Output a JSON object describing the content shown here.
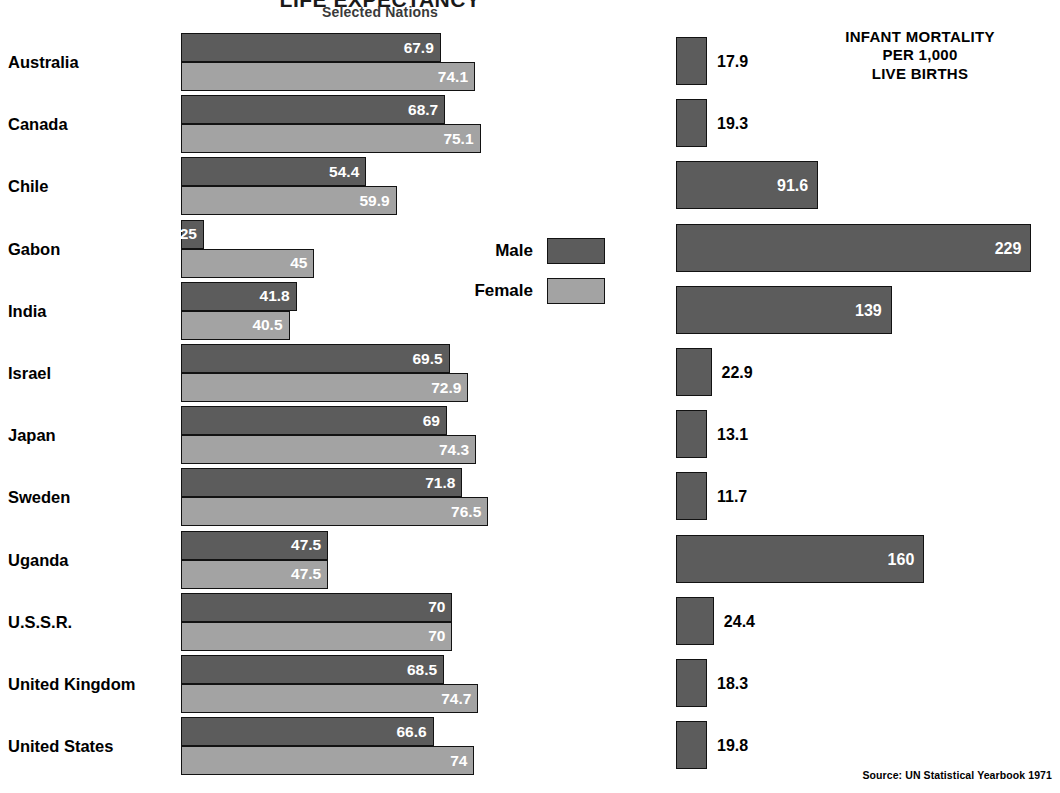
{
  "header": {
    "title": "LIFE EXPECTANCY",
    "subtitle": "Selected Nations",
    "mortality_title_line1": "INFANT MORTALITY",
    "mortality_title_line2": "PER 1,000",
    "mortality_title_line3": "LIVE BIRTHS"
  },
  "legend": {
    "male_label": "Male",
    "female_label": "Female",
    "male_color": "#5c5c5c",
    "female_color": "#a3a3a3"
  },
  "source": "Source: UN Statistical Yearbook 1971",
  "chart_data": {
    "type": "bar",
    "title": "LIFE EXPECTANCY",
    "subtitle": "Selected Nations",
    "orientation": "horizontal",
    "grid": false,
    "legend_position": "center-right",
    "categories": [
      "Australia",
      "Canada",
      "Chile",
      "Gabon",
      "India",
      "Israel",
      "Japan",
      "Sweden",
      "Uganda",
      "U.S.S.R.",
      "United Kingdom",
      "United States"
    ],
    "series": [
      {
        "name": "Male",
        "unit": "years",
        "color": "#5c5c5c",
        "values": [
          67.9,
          68.7,
          54.4,
          25,
          41.8,
          69.5,
          69,
          71.8,
          47.5,
          70,
          68.5,
          66.6
        ],
        "labels": [
          "67.9",
          "68.7",
          "54.4",
          "25",
          "41.8",
          "69.5",
          "69",
          "71.8",
          "47.5",
          "70",
          "68.5",
          "66.6"
        ]
      },
      {
        "name": "Female",
        "unit": "years",
        "color": "#a3a3a3",
        "values": [
          74.1,
          75.1,
          59.9,
          45,
          40.5,
          72.9,
          74.3,
          76.5,
          47.5,
          70,
          74.7,
          74
        ],
        "labels": [
          "74.1",
          "75.1",
          "59.9",
          "45",
          "40.5",
          "72.9",
          "74.3",
          "76.5",
          "47.5",
          "70",
          "74.7",
          "74"
        ]
      },
      {
        "name": "Infant mortality per 1,000 live births",
        "unit": "per 1,000 live births",
        "color": "#5c5c5c",
        "values": [
          17.9,
          19.3,
          91.6,
          229,
          139,
          22.9,
          13.1,
          11.7,
          160,
          24.4,
          18.3,
          19.8
        ],
        "labels": [
          "17.9",
          "19.3",
          "91.6",
          "229",
          "139",
          "22.9",
          "13.1",
          "11.7",
          "160",
          "24.4",
          "18.3",
          "19.8"
        ]
      }
    ],
    "xlabel": "",
    "ylabel": "",
    "life_expectancy_xlim": [
      0,
      80
    ],
    "mortality_xlim": [
      0,
      240
    ]
  }
}
